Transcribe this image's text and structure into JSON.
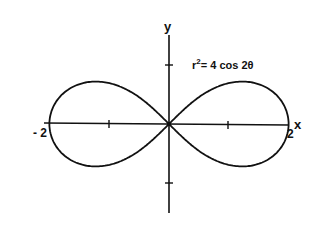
{
  "chart_data": {
    "type": "line",
    "equation": "r² = 4 cos 2θ",
    "equation_parts": {
      "lhs": "r",
      "exp": "2",
      "rhs": "= 4 cos 2θ"
    },
    "xlabel": "x",
    "ylabel": "y",
    "xlim": [
      -2,
      2
    ],
    "ylim": [
      -1.5,
      1.5
    ],
    "x_tick_labels": [
      "-2",
      "2"
    ],
    "x_ticks": [
      -2,
      -1,
      0,
      1,
      2
    ],
    "y_ticks": [
      -1,
      1
    ],
    "grid": false,
    "series": [
      {
        "name": "r^2 = 4 cos 2θ",
        "description": "lemniscate of Bernoulli, a = 2",
        "points": [
          [
            2,
            0
          ],
          [
            1.93,
            0.26
          ],
          [
            1.73,
            0.5
          ],
          [
            1.41,
            0.71
          ],
          [
            1.0,
            0.71
          ],
          [
            0.5,
            0.5
          ],
          [
            0,
            0
          ],
          [
            -0.5,
            0.5
          ],
          [
            -1.0,
            0.71
          ],
          [
            -1.41,
            0.71
          ],
          [
            -1.73,
            0.5
          ],
          [
            -1.93,
            0.26
          ],
          [
            -2,
            0
          ],
          [
            -1.93,
            -0.26
          ],
          [
            -1.73,
            -0.5
          ],
          [
            -1.41,
            -0.71
          ],
          [
            -1.0,
            -0.71
          ],
          [
            -0.5,
            -0.5
          ],
          [
            0,
            0
          ],
          [
            0.5,
            -0.5
          ],
          [
            1.0,
            -0.71
          ],
          [
            1.41,
            -0.71
          ],
          [
            1.73,
            -0.5
          ],
          [
            1.93,
            -0.26
          ],
          [
            2,
            0
          ]
        ]
      }
    ]
  },
  "labels": {
    "x_axis": "x",
    "y_axis": "y",
    "x_min": "- 2",
    "x_max": "2"
  }
}
